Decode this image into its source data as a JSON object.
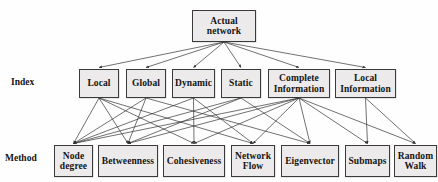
{
  "diagram": {
    "background_color": "#fefefe",
    "box_fill_color": "#eceaea",
    "box_border_color": "#3a3a3a",
    "edge_color": "#333333",
    "row_labels": {
      "index": "Index",
      "method": "Method"
    },
    "root": {
      "line1": "Actual",
      "line2": "network"
    },
    "index_nodes": [
      {
        "id": "local",
        "line1": "Local",
        "line2": ""
      },
      {
        "id": "global",
        "line1": "Global",
        "line2": ""
      },
      {
        "id": "dynamic",
        "line1": "Dynamic",
        "line2": ""
      },
      {
        "id": "static",
        "line1": "Static",
        "line2": ""
      },
      {
        "id": "complete-information",
        "line1": "Complete",
        "line2": "Information"
      },
      {
        "id": "local-information",
        "line1": "Local",
        "line2": "Information"
      }
    ],
    "method_nodes": [
      {
        "id": "node-degree",
        "line1": "Node",
        "line2": "degree"
      },
      {
        "id": "betweenness",
        "line1": "Betweenness",
        "line2": ""
      },
      {
        "id": "cohesiveness",
        "line1": "Cohesiveness",
        "line2": ""
      },
      {
        "id": "network-flow",
        "line1": "Network",
        "line2": "Flow"
      },
      {
        "id": "eigenvector",
        "line1": "Eigenvector",
        "line2": ""
      },
      {
        "id": "submaps",
        "line1": "Submaps",
        "line2": ""
      },
      {
        "id": "random-walk",
        "line1": "Random",
        "line2": "Walk"
      }
    ],
    "edges_root_to_index": [
      "local",
      "global",
      "dynamic",
      "static",
      "complete-information",
      "local-information"
    ],
    "edges_index_to_method": [
      {
        "from": "local",
        "to": "node-degree"
      },
      {
        "from": "local",
        "to": "betweenness"
      },
      {
        "from": "local",
        "to": "cohesiveness"
      },
      {
        "from": "local",
        "to": "network-flow"
      },
      {
        "from": "global",
        "to": "node-degree"
      },
      {
        "from": "global",
        "to": "betweenness"
      },
      {
        "from": "global",
        "to": "eigenvector"
      },
      {
        "from": "dynamic",
        "to": "node-degree"
      },
      {
        "from": "dynamic",
        "to": "cohesiveness"
      },
      {
        "from": "dynamic",
        "to": "network-flow"
      },
      {
        "from": "static",
        "to": "node-degree"
      },
      {
        "from": "static",
        "to": "betweenness"
      },
      {
        "from": "static",
        "to": "eigenvector"
      },
      {
        "from": "complete-information",
        "to": "node-degree"
      },
      {
        "from": "complete-information",
        "to": "betweenness"
      },
      {
        "from": "complete-information",
        "to": "cohesiveness"
      },
      {
        "from": "complete-information",
        "to": "network-flow"
      },
      {
        "from": "complete-information",
        "to": "eigenvector"
      },
      {
        "from": "complete-information",
        "to": "submaps"
      },
      {
        "from": "complete-information",
        "to": "random-walk"
      },
      {
        "from": "local-information",
        "to": "submaps"
      },
      {
        "from": "local-information",
        "to": "random-walk"
      }
    ]
  },
  "geometry": {
    "root": {
      "x": 192,
      "y": 10,
      "w": 64,
      "h": 32,
      "fs": 9.5
    },
    "index": [
      {
        "x": 79,
        "y": 69,
        "w": 40,
        "h": 29,
        "fs": 9.5
      },
      {
        "x": 126,
        "y": 69,
        "w": 40,
        "h": 29,
        "fs": 9.5
      },
      {
        "x": 172,
        "y": 69,
        "w": 43,
        "h": 29,
        "fs": 9.5
      },
      {
        "x": 221,
        "y": 69,
        "w": 40,
        "h": 29,
        "fs": 9.5
      },
      {
        "x": 268,
        "y": 69,
        "w": 62,
        "h": 29,
        "fs": 9.5
      },
      {
        "x": 335,
        "y": 69,
        "w": 61,
        "h": 29,
        "fs": 9.5
      }
    ],
    "method": [
      {
        "x": 54,
        "y": 145,
        "w": 39,
        "h": 32,
        "fs": 9.5
      },
      {
        "x": 98,
        "y": 145,
        "w": 60,
        "h": 32,
        "fs": 9.5
      },
      {
        "x": 163,
        "y": 145,
        "w": 62,
        "h": 32,
        "fs": 9.5
      },
      {
        "x": 231,
        "y": 145,
        "w": 44,
        "h": 32,
        "fs": 9.5
      },
      {
        "x": 281,
        "y": 145,
        "w": 58,
        "h": 32,
        "fs": 9.5
      },
      {
        "x": 345,
        "y": 145,
        "w": 45,
        "h": 32,
        "fs": 9.5
      },
      {
        "x": 394,
        "y": 145,
        "w": 43,
        "h": 32,
        "fs": 9.5
      }
    ],
    "row_label_index": {
      "x": 11,
      "y": 77
    },
    "row_label_method": {
      "x": 5,
      "y": 153
    }
  }
}
